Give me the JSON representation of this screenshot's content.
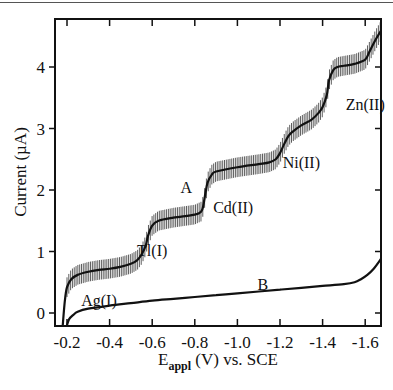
{
  "chart_data": {
    "type": "line",
    "title": "",
    "xlabel": "E_appl (V) vs. SCE",
    "xlabel_main": "E",
    "xlabel_sub": "appl",
    "xlabel_rest": " (V) vs. SCE",
    "ylabel": "Current (µA)",
    "xlim": [
      -0.17,
      -1.7
    ],
    "ylim": [
      -0.2,
      4.7
    ],
    "x_ticks": [
      -0.2,
      -0.4,
      -0.6,
      -0.8,
      -1.0,
      -1.2,
      -1.4,
      -1.6
    ],
    "x_tick_labels": [
      "-0.2",
      "-0.4",
      "-0.6",
      "-0.8",
      "-1.0",
      "-1.2",
      "-1.4",
      "-1.6"
    ],
    "y_ticks": [
      0,
      1,
      2,
      3,
      4
    ],
    "y_tick_labels": [
      "0",
      "1",
      "2",
      "3",
      "4"
    ],
    "grid": false,
    "series": [
      {
        "name": "A",
        "error_bars": true,
        "x": [
          -0.18,
          -0.19,
          -0.2,
          -0.22,
          -0.25,
          -0.3,
          -0.35,
          -0.4,
          -0.45,
          -0.5,
          -0.53,
          -0.55,
          -0.57,
          -0.58,
          -0.6,
          -0.63,
          -0.7,
          -0.8,
          -0.83,
          -0.84,
          -0.85,
          -0.86,
          -0.88,
          -0.9,
          -1.0,
          -1.1,
          -1.15,
          -1.18,
          -1.2,
          -1.22,
          -1.24,
          -1.26,
          -1.3,
          -1.35,
          -1.38,
          -1.4,
          -1.42,
          -1.43,
          -1.45,
          -1.47,
          -1.5,
          -1.55,
          -1.6,
          -1.62,
          -1.65,
          -1.68,
          -1.7
        ],
        "values": [
          -0.2,
          0.2,
          0.42,
          0.55,
          0.62,
          0.67,
          0.7,
          0.72,
          0.75,
          0.8,
          0.86,
          0.95,
          1.1,
          1.25,
          1.42,
          1.5,
          1.55,
          1.6,
          1.65,
          1.75,
          1.95,
          2.12,
          2.25,
          2.3,
          2.37,
          2.42,
          2.45,
          2.5,
          2.6,
          2.75,
          2.88,
          2.95,
          3.05,
          3.15,
          3.25,
          3.35,
          3.55,
          3.78,
          3.95,
          4.0,
          4.02,
          4.05,
          4.12,
          4.25,
          4.45,
          4.62,
          4.7
        ],
        "error_half_height": 0.16
      },
      {
        "name": "B",
        "error_bars": false,
        "x": [
          -0.2,
          -0.21,
          -0.23,
          -0.25,
          -0.3,
          -0.4,
          -0.5,
          -0.6,
          -0.7,
          -0.8,
          -0.9,
          -1.0,
          -1.1,
          -1.2,
          -1.3,
          -1.4,
          -1.5,
          -1.55,
          -1.58,
          -1.61,
          -1.64,
          -1.67,
          -1.7
        ],
        "values": [
          -0.2,
          -0.1,
          -0.03,
          0.02,
          0.07,
          0.12,
          0.16,
          0.2,
          0.23,
          0.26,
          0.29,
          0.32,
          0.35,
          0.38,
          0.41,
          0.44,
          0.47,
          0.5,
          0.55,
          0.62,
          0.72,
          0.86,
          1.02
        ]
      }
    ],
    "annotations": [
      {
        "text": "A",
        "x": -0.76,
        "y": 1.95
      },
      {
        "text": "B",
        "x": -1.12,
        "y": 0.38
      },
      {
        "text": "Ag(I)",
        "x": -0.35,
        "y": 0.12
      },
      {
        "text": "Tl(I)",
        "x": -0.6,
        "y": 0.92
      },
      {
        "text": "Cd(II)",
        "x": -0.98,
        "y": 1.62
      },
      {
        "text": "Ni(II)",
        "x": -1.3,
        "y": 2.35
      },
      {
        "text": "Zn(II)",
        "x": -1.6,
        "y": 3.3
      }
    ],
    "legend": null
  }
}
